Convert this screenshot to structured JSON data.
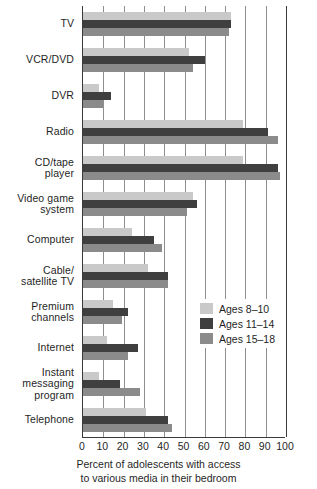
{
  "chart_data": {
    "type": "bar",
    "orientation": "horizontal",
    "title": "",
    "xlabel": "Percent of adolescents with access to various media in their bedroom",
    "xlabel_lines": [
      "Percent of adolescents with access",
      "to various media in their bedroom"
    ],
    "ylabel": "",
    "xlim": [
      0,
      100
    ],
    "xticks": [
      0,
      10,
      20,
      30,
      40,
      50,
      60,
      70,
      80,
      90,
      100
    ],
    "xtick_labels": [
      "0",
      "10",
      "20",
      "30",
      "40",
      "50",
      "60",
      "70",
      "80",
      "90",
      "100"
    ],
    "grid": true,
    "grid_axis": "x",
    "legend_position": "center-right",
    "categories": [
      "TV",
      "VCR/DVD",
      "DVR",
      "Radio",
      "CD/tape player",
      "Video game system",
      "Computer",
      "Cable/ satellite TV",
      "Premium channels",
      "Internet",
      "Instant messaging program",
      "Telephone"
    ],
    "category_lines": [
      [
        "TV"
      ],
      [
        "VCR/DVD"
      ],
      [
        "DVR"
      ],
      [
        "Radio"
      ],
      [
        "CD/tape",
        "player"
      ],
      [
        "Video game",
        "system"
      ],
      [
        "Computer"
      ],
      [
        "Cable/",
        "satellite TV"
      ],
      [
        "Premium",
        "channels"
      ],
      [
        "Internet"
      ],
      [
        "Instant",
        "messaging",
        "program"
      ],
      [
        "Telephone"
      ]
    ],
    "series": [
      {
        "name": "Ages 8–10",
        "color": "#c9c9c9",
        "values": [
          73,
          52,
          8,
          79,
          79,
          54,
          24,
          32,
          15,
          12,
          8,
          31
        ]
      },
      {
        "name": "Ages 11–14",
        "color": "#3f3f3f",
        "values": [
          73,
          60,
          14,
          91,
          96,
          56,
          35,
          42,
          22,
          27,
          18,
          42
        ]
      },
      {
        "name": "Ages 15–18",
        "color": "#8b8b8b",
        "values": [
          72,
          54,
          10,
          96,
          97,
          51,
          39,
          42,
          19,
          22,
          28,
          44
        ]
      }
    ]
  },
  "legend": {
    "items": [
      {
        "label": "Ages 8–10",
        "color": "#c9c9c9"
      },
      {
        "label": "Ages 11–14",
        "color": "#3f3f3f"
      },
      {
        "label": "Ages 15–18",
        "color": "#8b8b8b"
      }
    ]
  },
  "colors": {
    "series_light": "#c9c9c9",
    "series_dark": "#3f3f3f",
    "series_medium": "#8b8b8b",
    "axis": "#3a3a3a",
    "grid": "#8f8f8f",
    "text": "#1f1f1f",
    "background": "#ffffff"
  }
}
